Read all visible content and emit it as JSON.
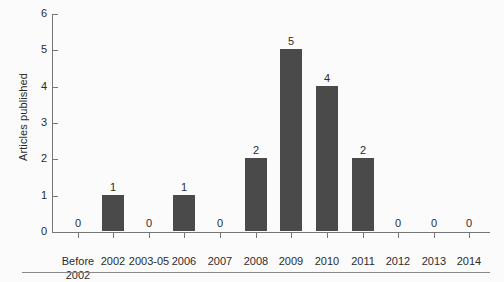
{
  "chart_data": {
    "type": "bar",
    "title": "",
    "subtitle": "",
    "xlabel": "",
    "ylabel": "Articles published",
    "categories": [
      "Before\n2002",
      "2002",
      "2003-05",
      "2006",
      "2007",
      "2008",
      "2009",
      "2010",
      "2011",
      "2012",
      "2013",
      "2014"
    ],
    "values": [
      0,
      1,
      0,
      1,
      0,
      2,
      5,
      4,
      2,
      0,
      0,
      0
    ],
    "data_labels": [
      "0",
      "1",
      "0",
      "1",
      "0",
      "2",
      "5",
      "4",
      "2",
      "0",
      "0",
      "0"
    ],
    "ylim": [
      0,
      6
    ],
    "y_ticks": [
      0,
      1,
      2,
      3,
      4,
      5,
      6
    ],
    "y_tick_labels": [
      "0",
      "1",
      "2",
      "3",
      "4",
      "5",
      "6"
    ],
    "grid": false,
    "legend": false,
    "legend_position": "none",
    "bar_color": "#4a4a4a",
    "axis_color": "#777777",
    "text_color": "#2b2b2b",
    "background_color": "#fbfbfb"
  }
}
